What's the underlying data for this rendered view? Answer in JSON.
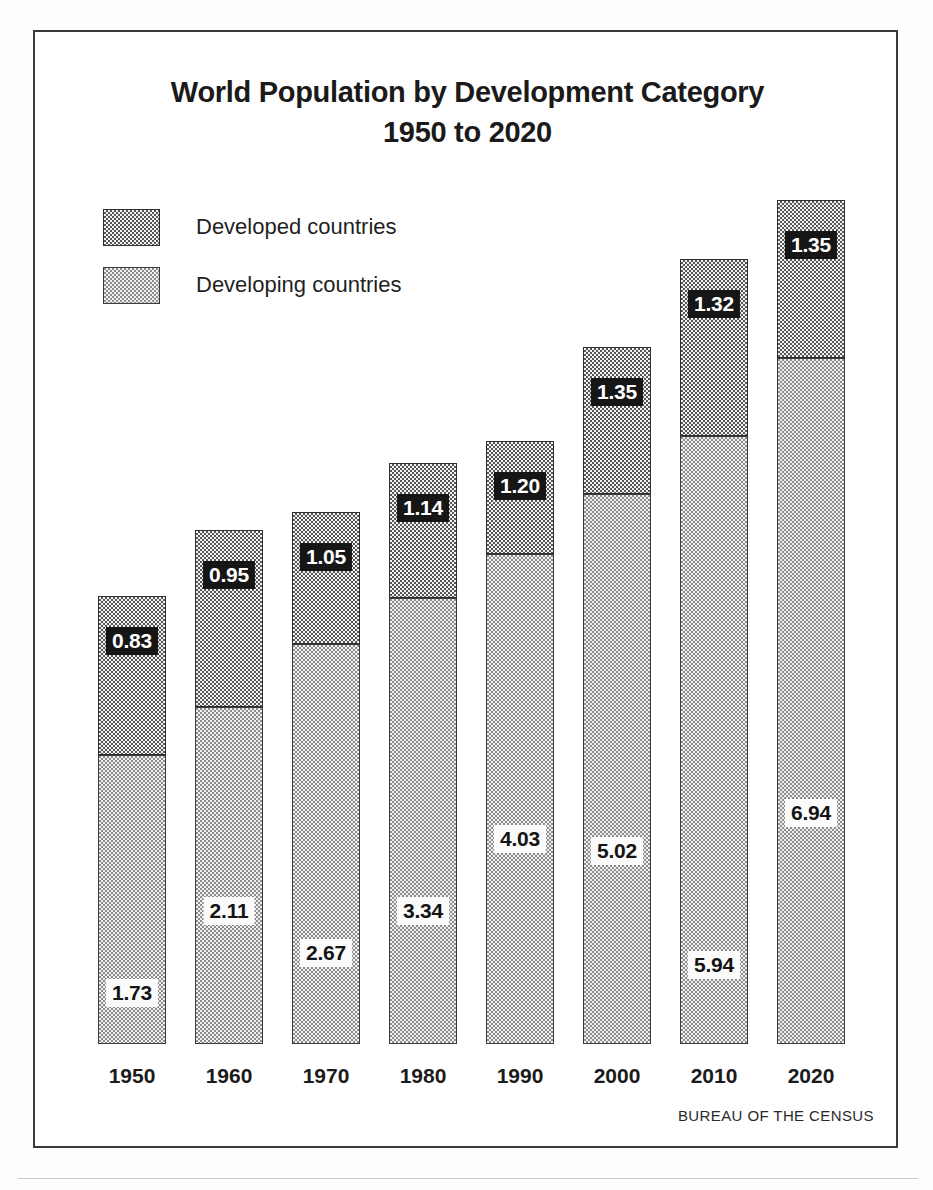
{
  "title": {
    "line1": "World Population by Development Category",
    "line2": "1950 to 2020"
  },
  "source": "BUREAU OF THE CENSUS",
  "legend": {
    "items": [
      {
        "label": "Developed countries",
        "swatch": "dark-dotted",
        "color": "#575757"
      },
      {
        "label": "Developing countries",
        "swatch": "light-dotted",
        "color": "#f0f0f0"
      }
    ]
  },
  "chart_data": {
    "type": "bar",
    "subtype": "stacked-vertical",
    "title": "World Population by Development Category 1950 to 2020",
    "xlabel": "",
    "ylabel": "",
    "unit": "billions of people",
    "grid": false,
    "legend_position": "top-left",
    "categories": [
      "1950",
      "1960",
      "1970",
      "1980",
      "1990",
      "2000",
      "2010",
      "2020"
    ],
    "series": [
      {
        "name": "Developing countries",
        "stack_order": 1,
        "color": "#f0f0f0",
        "pattern": "light-dotted",
        "values": [
          1.73,
          2.11,
          2.67,
          3.34,
          4.03,
          5.02,
          5.94,
          6.94
        ]
      },
      {
        "name": "Developed countries",
        "stack_order": 2,
        "color": "#575757",
        "pattern": "dark-dotted",
        "values": [
          0.83,
          0.95,
          1.05,
          1.14,
          1.2,
          1.35,
          1.32,
          1.35
        ]
      }
    ],
    "totals": [
      2.56,
      3.06,
      3.72,
      4.48,
      5.23,
      6.37,
      7.26,
      8.29
    ],
    "ylim": [
      0,
      8.29
    ],
    "bars": [
      {
        "year": "1950",
        "developing": "1.73",
        "developed": "0.83",
        "developing_px": 289,
        "developed_px": 159,
        "left_px": 63
      },
      {
        "year": "1960",
        "developing": "2.11",
        "developed": "0.95",
        "developing_px": 337,
        "developed_px": 177,
        "left_px": 160
      },
      {
        "year": "1970",
        "developing": "2.67",
        "developed": "1.05",
        "developing_px": 400,
        "developed_px": 132,
        "left_px": 257
      },
      {
        "year": "1980",
        "developing": "3.34",
        "developed": "1.14",
        "developing_px": 446,
        "developed_px": 135,
        "left_px": 354
      },
      {
        "year": "1990",
        "developing": "4.03",
        "developed": "1.20",
        "developing_px": 490,
        "developed_px": 113,
        "left_px": 451
      },
      {
        "year": "2000",
        "developing": "5.02",
        "developed": "1.35",
        "developing_px": 550,
        "developed_px": 147,
        "left_px": 548
      },
      {
        "year": "2010",
        "developing": "5.94",
        "developed": "1.32",
        "developing_px": 608,
        "developed_px": 177,
        "left_px": 645
      },
      {
        "year": "2020",
        "developing": "6.94",
        "developed": "1.35",
        "developing_px": 686,
        "developed_px": 158,
        "left_px": 742
      }
    ]
  }
}
